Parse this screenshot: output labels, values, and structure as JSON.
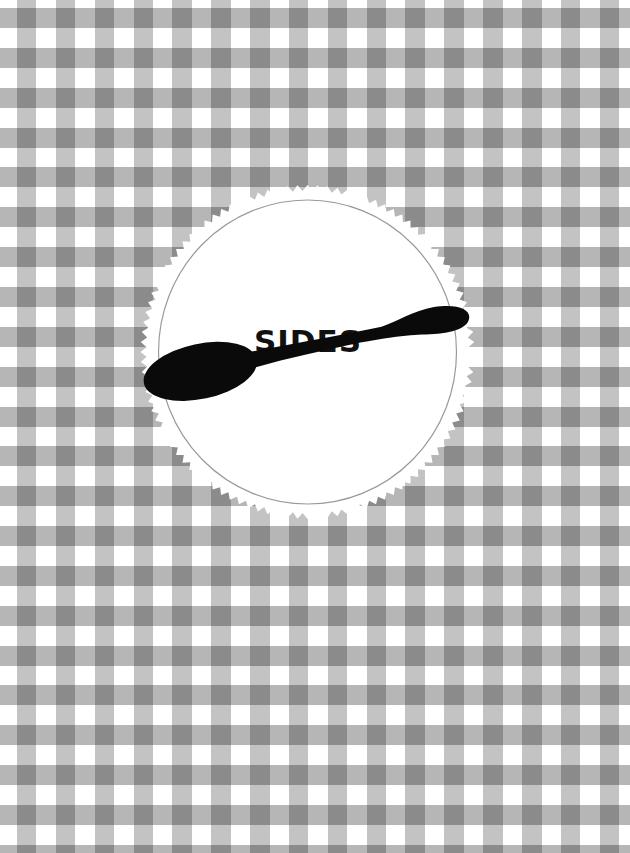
{
  "page": {
    "background": {
      "pattern": "gingham",
      "base_color": "#ffffff",
      "band_color": "#bdbdbd",
      "intersection_color": "#8f8f8f"
    },
    "medallion": {
      "title": "SIDES",
      "title_color": "#111111",
      "fill_color": "#ffffff",
      "border_color": "#9a9a9a",
      "icon": "spoon-icon"
    }
  }
}
